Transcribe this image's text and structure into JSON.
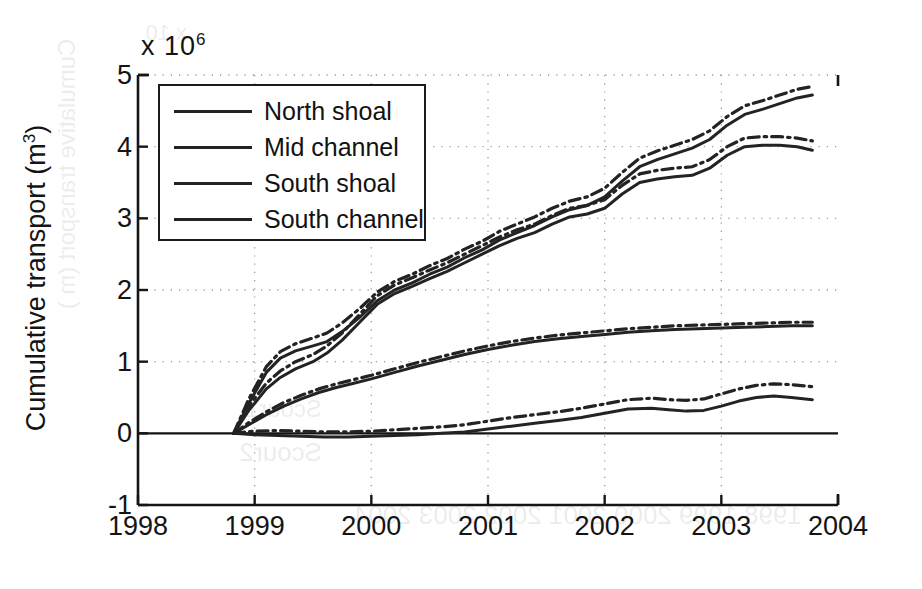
{
  "figure": {
    "axis_y_label_main": "Cumulative transport (m",
    "axis_y_label_sup": "3",
    "axis_y_label_close": ")",
    "exponent_prefix": "x 10",
    "exponent_power": "6",
    "line_color": "#232323",
    "grid_color": "#9a9a9a",
    "axis_color": "#151515",
    "background": "#ffffff"
  },
  "legend": {
    "items": [
      {
        "label": "North shoal",
        "style": "solid"
      },
      {
        "label": "Mid channel",
        "style": "solid"
      },
      {
        "label": "South shoal",
        "style": "solid"
      },
      {
        "label": "South channel",
        "style": "solid"
      }
    ]
  },
  "bleed_through": [
    {
      "text": "x 10",
      "x": 735,
      "y": 20,
      "size": 22,
      "rot": 0
    },
    {
      "text": "Scour2",
      "x": 600,
      "y": 437,
      "size": 26,
      "rot": 0
    },
    {
      "text": "Scour1",
      "x": 600,
      "y": 395,
      "size": 24,
      "rot": 0
    },
    {
      "text": "1998 1999 2000 2001 2002 2003 2004",
      "x": 120,
      "y": 500,
      "size": 26,
      "rot": 0
    },
    {
      "text": "Cumulative transport (m )",
      "x": 720,
      "y": 160,
      "size": 24,
      "rot": 90
    }
  ],
  "chart_data": {
    "type": "line",
    "title": "",
    "xlabel": "",
    "ylabel": "Cumulative transport (m^3)",
    "y_exponent": 1000000,
    "xlim": [
      1998,
      2004
    ],
    "ylim": [
      -1,
      5
    ],
    "xticks": [
      1998,
      1999,
      2000,
      2001,
      2002,
      2003,
      2004
    ],
    "xtick_labels": [
      "1998",
      "1999",
      "2000",
      "2001",
      "2002",
      "2003",
      "2004"
    ],
    "yticks": [
      -1,
      0,
      1,
      2,
      3,
      4,
      5
    ],
    "ytick_labels": [
      "-1",
      "0",
      "1",
      "2",
      "3",
      "4",
      "5"
    ],
    "grid": true,
    "grid_style": "dotted",
    "legend_position": "upper left",
    "series": [
      {
        "name": "North shoal",
        "style": "solid",
        "x": [
          1998.82,
          1998.95,
          1999.1,
          1999.22,
          1999.35,
          1999.5,
          1999.62,
          1999.75,
          1999.9,
          2000.05,
          2000.2,
          2000.35,
          2000.5,
          2000.65,
          2000.8,
          2000.95,
          2001.1,
          2001.25,
          2001.4,
          2001.55,
          2001.7,
          2001.85,
          2002.0,
          2002.15,
          2002.3,
          2002.45,
          2002.6,
          2002.75,
          2002.9,
          2003.05,
          2003.2,
          2003.35,
          2003.5,
          2003.65,
          2003.78
        ],
        "y": [
          0.0,
          0.42,
          0.85,
          1.05,
          1.15,
          1.22,
          1.28,
          1.42,
          1.62,
          1.85,
          2.0,
          2.1,
          2.22,
          2.32,
          2.45,
          2.56,
          2.7,
          2.8,
          2.9,
          3.02,
          3.12,
          3.18,
          3.3,
          3.52,
          3.72,
          3.82,
          3.9,
          3.98,
          4.1,
          4.3,
          4.45,
          4.52,
          4.6,
          4.68,
          4.72
        ]
      },
      {
        "name": "North shoal (dash-dot companion)",
        "style": "dashdot",
        "x": [
          1998.82,
          1998.95,
          1999.1,
          1999.22,
          1999.35,
          1999.5,
          1999.62,
          1999.75,
          1999.9,
          2000.05,
          2000.2,
          2000.35,
          2000.5,
          2000.65,
          2000.8,
          2000.95,
          2001.1,
          2001.25,
          2001.4,
          2001.55,
          2001.7,
          2001.85,
          2002.0,
          2002.15,
          2002.3,
          2002.45,
          2002.6,
          2002.75,
          2002.9,
          2003.05,
          2003.2,
          2003.35,
          2003.5,
          2003.65,
          2003.78
        ],
        "y": [
          0.0,
          0.48,
          0.93,
          1.14,
          1.25,
          1.33,
          1.4,
          1.54,
          1.74,
          1.97,
          2.12,
          2.22,
          2.34,
          2.44,
          2.57,
          2.68,
          2.82,
          2.92,
          3.02,
          3.14,
          3.24,
          3.3,
          3.42,
          3.64,
          3.84,
          3.94,
          4.02,
          4.1,
          4.22,
          4.42,
          4.57,
          4.64,
          4.72,
          4.8,
          4.84
        ]
      },
      {
        "name": "Mid channel",
        "style": "solid",
        "x": [
          1998.82,
          1998.95,
          1999.1,
          1999.22,
          1999.35,
          1999.5,
          1999.62,
          1999.75,
          1999.9,
          2000.05,
          2000.2,
          2000.35,
          2000.5,
          2000.65,
          2000.8,
          2000.95,
          2001.1,
          2001.25,
          2001.4,
          2001.55,
          2001.7,
          2001.85,
          2002.0,
          2002.15,
          2002.3,
          2002.45,
          2002.6,
          2002.75,
          2002.9,
          2003.05,
          2003.2,
          2003.35,
          2003.5,
          2003.65,
          2003.78
        ],
        "y": [
          0.0,
          0.32,
          0.62,
          0.78,
          0.9,
          1.0,
          1.12,
          1.3,
          1.55,
          1.8,
          1.95,
          2.05,
          2.16,
          2.26,
          2.38,
          2.5,
          2.62,
          2.72,
          2.8,
          2.92,
          3.02,
          3.06,
          3.14,
          3.34,
          3.5,
          3.55,
          3.58,
          3.6,
          3.7,
          3.88,
          4.0,
          4.02,
          4.02,
          4.0,
          3.95
        ]
      },
      {
        "name": "Mid channel (dash-dot companion)",
        "style": "dashdot",
        "x": [
          1998.82,
          1998.95,
          1999.1,
          1999.22,
          1999.35,
          1999.5,
          1999.62,
          1999.75,
          1999.9,
          2000.05,
          2000.2,
          2000.35,
          2000.5,
          2000.65,
          2000.8,
          2000.95,
          2001.1,
          2001.25,
          2001.4,
          2001.55,
          2001.7,
          2001.85,
          2002.0,
          2002.15,
          2002.3,
          2002.45,
          2002.6,
          2002.75,
          2002.9,
          2003.05,
          2003.2,
          2003.35,
          2003.5,
          2003.65,
          2003.78
        ],
        "y": [
          0.0,
          0.38,
          0.7,
          0.87,
          1.0,
          1.1,
          1.22,
          1.4,
          1.66,
          1.92,
          2.07,
          2.17,
          2.28,
          2.38,
          2.5,
          2.62,
          2.74,
          2.84,
          2.92,
          3.04,
          3.14,
          3.18,
          3.26,
          3.46,
          3.62,
          3.67,
          3.7,
          3.72,
          3.82,
          4.0,
          4.12,
          4.14,
          4.14,
          4.12,
          4.08
        ]
      },
      {
        "name": "South shoal",
        "style": "solid",
        "x": [
          1998.82,
          1998.95,
          1999.1,
          1999.25,
          1999.4,
          1999.55,
          1999.7,
          1999.85,
          2000.0,
          2000.2,
          2000.4,
          2000.6,
          2000.8,
          2001.0,
          2001.2,
          2001.4,
          2001.6,
          2001.8,
          2002.0,
          2002.2,
          2002.4,
          2002.6,
          2002.8,
          2003.0,
          2003.2,
          2003.4,
          2003.6,
          2003.78
        ],
        "y": [
          0.0,
          0.12,
          0.26,
          0.38,
          0.48,
          0.57,
          0.64,
          0.7,
          0.76,
          0.85,
          0.94,
          1.02,
          1.1,
          1.17,
          1.23,
          1.28,
          1.32,
          1.35,
          1.38,
          1.41,
          1.43,
          1.45,
          1.46,
          1.47,
          1.48,
          1.49,
          1.5,
          1.5
        ]
      },
      {
        "name": "South shoal (dash-dot companion)",
        "style": "dashdot",
        "x": [
          1998.82,
          1998.95,
          1999.1,
          1999.25,
          1999.4,
          1999.55,
          1999.7,
          1999.85,
          2000.0,
          2000.2,
          2000.4,
          2000.6,
          2000.8,
          2001.0,
          2001.2,
          2001.4,
          2001.6,
          2001.8,
          2002.0,
          2002.2,
          2002.4,
          2002.6,
          2002.8,
          2003.0,
          2003.2,
          2003.4,
          2003.6,
          2003.78
        ],
        "y": [
          0.0,
          0.15,
          0.3,
          0.43,
          0.53,
          0.62,
          0.69,
          0.75,
          0.81,
          0.9,
          0.99,
          1.07,
          1.15,
          1.22,
          1.28,
          1.33,
          1.37,
          1.4,
          1.43,
          1.46,
          1.48,
          1.5,
          1.51,
          1.52,
          1.53,
          1.54,
          1.55,
          1.55
        ]
      },
      {
        "name": "South channel",
        "style": "solid",
        "x": [
          1998.82,
          1999.0,
          1999.2,
          1999.4,
          1999.6,
          1999.8,
          2000.0,
          2000.2,
          2000.4,
          2000.6,
          2000.8,
          2001.0,
          2001.2,
          2001.4,
          2001.6,
          2001.8,
          2002.0,
          2002.2,
          2002.4,
          2002.55,
          2002.7,
          2002.85,
          2003.0,
          2003.15,
          2003.3,
          2003.45,
          2003.6,
          2003.78
        ],
        "y": [
          0.0,
          -0.02,
          -0.03,
          -0.04,
          -0.05,
          -0.05,
          -0.04,
          -0.03,
          -0.02,
          0.0,
          0.02,
          0.06,
          0.1,
          0.14,
          0.18,
          0.22,
          0.28,
          0.34,
          0.35,
          0.33,
          0.31,
          0.32,
          0.38,
          0.45,
          0.5,
          0.52,
          0.5,
          0.47
        ]
      },
      {
        "name": "South channel (dash-dot companion)",
        "style": "dashdot",
        "x": [
          1998.82,
          1999.0,
          1999.2,
          1999.4,
          1999.6,
          1999.8,
          2000.0,
          2000.2,
          2000.4,
          2000.6,
          2000.8,
          2001.0,
          2001.2,
          2001.4,
          2001.6,
          2001.8,
          2002.0,
          2002.2,
          2002.4,
          2002.55,
          2002.7,
          2002.85,
          2003.0,
          2003.15,
          2003.3,
          2003.45,
          2003.6,
          2003.78
        ],
        "y": [
          0.0,
          0.03,
          0.04,
          0.03,
          0.02,
          0.02,
          0.03,
          0.05,
          0.07,
          0.09,
          0.12,
          0.17,
          0.22,
          0.26,
          0.3,
          0.35,
          0.41,
          0.47,
          0.49,
          0.47,
          0.46,
          0.48,
          0.55,
          0.62,
          0.67,
          0.69,
          0.68,
          0.65
        ]
      }
    ]
  }
}
